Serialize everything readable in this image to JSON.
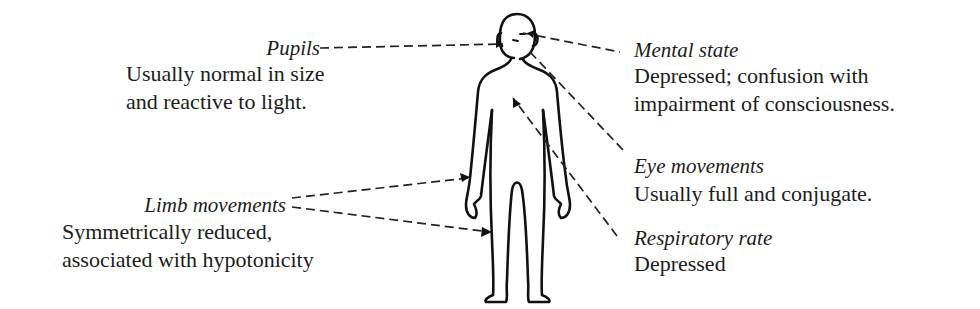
{
  "annotations": {
    "pupils": {
      "label": "Pupils",
      "lines": [
        "Usually normal in size",
        "and reactive to light."
      ]
    },
    "limb_movements": {
      "label": "Limb movements",
      "lines": [
        "Symmetrically reduced,",
        "associated with hypotonicity"
      ]
    },
    "mental_state": {
      "label": "Mental state",
      "lines": [
        "Depressed; confusion with",
        "impairment of consciousness."
      ]
    },
    "eye_movements": {
      "label": "Eye movements",
      "lines": [
        "Usually full and conjugate."
      ]
    },
    "respiratory_rate": {
      "label": "Respiratory rate",
      "lines": [
        "Depressed"
      ]
    }
  },
  "figure": {
    "icon": "human-body-outline-icon",
    "line_color": "#111111",
    "leader_style": "dashed"
  }
}
